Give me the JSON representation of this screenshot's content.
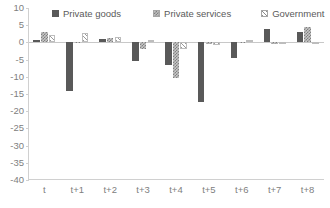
{
  "chart_data": {
    "type": "bar",
    "title": "",
    "xlabel": "",
    "ylabel": "",
    "ylim": [
      -40,
      10
    ],
    "ytick_step": 5,
    "yticks": [
      10,
      5,
      0,
      -5,
      -10,
      -15,
      -20,
      -25,
      -30,
      -35,
      -40
    ],
    "ytick_labels": [
      "10",
      "5",
      "0",
      "-5",
      "-10",
      "-15",
      "-20",
      "-25",
      "-30",
      "-35",
      "-40"
    ],
    "grid": false,
    "legend_position": "top",
    "categories": [
      "t",
      "t+1",
      "t+2",
      "t+3",
      "t+4",
      "t+5",
      "t+6",
      "t+7",
      "t+8"
    ],
    "series": [
      {
        "name": "Private goods",
        "pattern": "solid",
        "color": "#595959",
        "values": [
          0.6,
          -14.0,
          1.1,
          -5.3,
          -6.7,
          -17.4,
          -4.6,
          4.0,
          2.9
        ]
      },
      {
        "name": "Private services",
        "pattern": "checkered",
        "color": "#c7c7c7",
        "values": [
          3.0,
          0.2,
          1.2,
          -1.8,
          -10.3,
          -0.5,
          -0.2,
          -0.4,
          4.5
        ]
      },
      {
        "name": "Government",
        "pattern": "diagonal-hatch",
        "color": "#ffffff",
        "values": [
          2.2,
          2.6,
          1.6,
          0.7,
          -2.0,
          -0.7,
          0.6,
          -0.3,
          -0.6
        ]
      }
    ]
  },
  "legend": {
    "items": [
      {
        "label": "Private goods",
        "swatch": "solid-square-icon"
      },
      {
        "label": "Private services",
        "swatch": "checkered-square-icon"
      },
      {
        "label": "Government",
        "swatch": "hatched-square-icon"
      }
    ]
  },
  "axes": {
    "y_tick_labels": [
      "10",
      "5",
      "0",
      "-5",
      "-10",
      "-15",
      "-20",
      "-25",
      "-30",
      "-35",
      "-40"
    ],
    "x_tick_labels": [
      "t",
      "t+1",
      "t+2",
      "t+3",
      "t+4",
      "t+5",
      "t+6",
      "t+7",
      "t+8"
    ]
  }
}
